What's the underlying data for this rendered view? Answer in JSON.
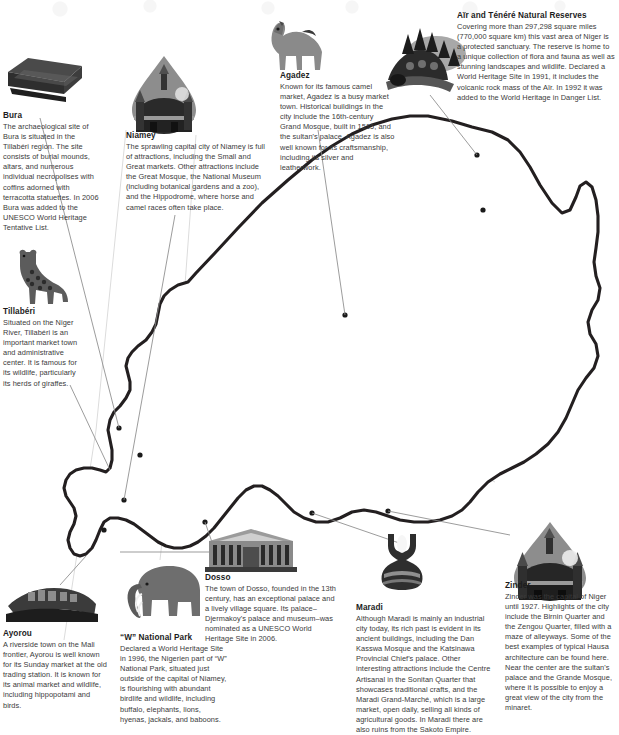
{
  "document": {
    "subject": "Tourist attractions map of Niger",
    "background_color": "#ffffff",
    "outline_color": "#231f20",
    "region_line_color": "#d9d9d9",
    "leader_line_color": "#808080",
    "marker_color": "#1a1a1a",
    "heading_color": "#1c1c1c",
    "body_color": "#3a3a3a"
  },
  "entries": [
    {
      "id": "bura",
      "title": "Bura",
      "body": "The archaeological site of Bura is situated in the Tillabéri region. The site consists of burial mounds, altars, and numerous individual necropolises with coffins adorned with terracotta statuettes. In 2006 Bura was added to the UNESCO World Heritage Tentative List.",
      "icon": "sarcophagus-icon"
    },
    {
      "id": "niamey",
      "title": "Niamey",
      "body": "The sprawling capital city of Niamey is full of attractions, including the Small and Great markets. Other attractions include the Great Mosque, the National Museum (including botanical gardens and a zoo), and the Hippodrome, where horse and camel races often take place.",
      "icon": "mosque-dome-icon"
    },
    {
      "id": "agadez",
      "title": "Agadez",
      "body": "Known for its famous camel market, Agadez is a busy market town. Historical buildings in the city include the 16th-century Grand Mosque, built in 1515, and the sultan's palace. Agadez is also well known for its craftsmanship, including its silver and leatherwork.",
      "icon": "camel-icon"
    },
    {
      "id": "air-tenere",
      "title": "Aïr and Ténéré Natural Reserves",
      "body": "Covering more than 297,298 square miles (770,000 square km) this vast area of Niger is a protected sanctuary. The reserve is home to a unique collection of flora and fauna as well as stunning landscapes and wildlife. Declared a World Heritage Site in 1991, it includes the volcanic rock mass of the Aïr. In 1992 it was added to the World Heritage in Danger List.",
      "icon": "mountain-massif-icon"
    },
    {
      "id": "tillaberi",
      "title": "Tillabéri",
      "body": "Situated on the Niger River, Tillabéri is an important market town and administrative center. It is famous for its wildlife, particularly its herds of giraffes.",
      "icon": "giraffe-icon"
    },
    {
      "id": "ayorou",
      "title": "Ayorou",
      "body": "A riverside town on the Mali frontier, Ayorou is well known for its Sunday market at the old trading station. It is known for its animal market and wildlife, including hippopotami and birds.",
      "icon": "riverside-town-icon"
    },
    {
      "id": "w-national-park",
      "title": "“W” National Park",
      "body": "Declared a World Heritage Site in 1996, the Nigerien part of “W” National Park, situated just outside of the capital of Niamey, is flourishing with abundant birdlife and wildlife, including buffalo, elephants, lions, hyenas, jackals, and baboons.",
      "icon": "elephant-icon"
    },
    {
      "id": "dosso",
      "title": "Dosso",
      "body": "The town of Dosso, founded in the 13th century, has an exceptional palace and a lively village square. Its palace–Djermakoy's palace and museum–was nominated as a UNESCO World Heritage Site in 2006.",
      "icon": "palace-building-icon"
    },
    {
      "id": "maradi",
      "title": "Maradi",
      "body": "Although Maradi is mainly an industrial city today, its rich past is evident in its ancient buildings, including the Dan Kasswa Mosque and the Katsinawa Provincial Chief's palace. Other interesting attractions include the Centre Artisanal in the Sonitan Quarter that showcases traditional crafts, and the Maradi Grand-Marché, which is a large market, open daily, selling all kinds of agricultural goods. In Maradi there are also ruins from the Sakoto Empire.",
      "icon": "pottery-vase-icon"
    },
    {
      "id": "zinder",
      "title": "Zinder",
      "body": "Zinder was the capital of Niger until 1927. Highlights of the city include the Birnin Quarter and the Zengou Quarter, filled with a maze of alleyways. Some of the best examples of typical Hausa architecture can be found here. Near the center are the sultan's palace and the Grande Mosque, where it is possible to enjoy a great view of the city from the minaret.",
      "icon": "mosque-dome-icon"
    }
  ],
  "map": {
    "country": "Niger",
    "markers": [
      {
        "id": "marker-agadez",
        "x": 483,
        "y": 210
      },
      {
        "id": "marker-air-tenere",
        "x": 477,
        "y": 155
      },
      {
        "id": "marker-arlit",
        "x": 345,
        "y": 315
      },
      {
        "id": "marker-tillaberi",
        "x": 140,
        "y": 455
      },
      {
        "id": "marker-ayorou",
        "x": 104,
        "y": 530
      },
      {
        "id": "marker-dosso",
        "x": 205,
        "y": 522
      },
      {
        "id": "marker-maradi",
        "x": 312,
        "y": 513
      },
      {
        "id": "marker-zinder",
        "x": 388,
        "y": 511
      },
      {
        "id": "marker-bura",
        "x": 119,
        "y": 428
      },
      {
        "id": "marker-niamey",
        "x": 124,
        "y": 500
      }
    ]
  }
}
